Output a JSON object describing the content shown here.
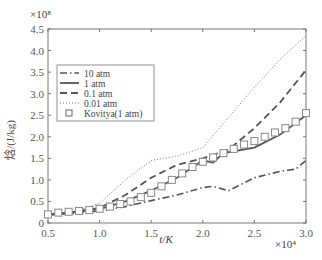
{
  "chart_data": {
    "type": "line",
    "title": "",
    "xlabel": "t/K",
    "ylabel": "焓/(J/kg)",
    "x_multiplier": "×10⁴",
    "y_multiplier": "×10⁸",
    "xlim": [
      0.5,
      3.0
    ],
    "ylim": [
      0,
      4.5
    ],
    "xticks": [
      "0.5",
      "1.0",
      "1.5",
      "2.0",
      "2.5",
      "3.0"
    ],
    "yticks": [
      "0",
      "0.5",
      "1.0",
      "1.5",
      "2.0",
      "2.5",
      "3.0",
      "3.5",
      "4.0",
      "4.5"
    ],
    "grid": false,
    "legend_position": "upper left",
    "series": [
      {
        "name": "10 atm",
        "style": "dash-dot",
        "x": [
          0.5,
          0.75,
          1.0,
          1.25,
          1.5,
          1.75,
          2.0,
          2.1,
          2.25,
          2.5,
          2.75,
          2.9,
          3.0
        ],
        "y": [
          0.18,
          0.22,
          0.28,
          0.38,
          0.52,
          0.65,
          0.82,
          0.85,
          0.75,
          1.05,
          1.2,
          1.25,
          1.45
        ]
      },
      {
        "name": "1 atm",
        "style": "solid",
        "x": [
          0.5,
          0.75,
          1.0,
          1.25,
          1.5,
          1.75,
          2.0,
          2.1,
          2.2,
          2.5,
          2.75,
          3.0
        ],
        "y": [
          0.2,
          0.25,
          0.32,
          0.5,
          0.75,
          1.05,
          1.45,
          1.4,
          1.62,
          1.75,
          2.05,
          2.5
        ]
      },
      {
        "name": "0.1 atm",
        "style": "dashed",
        "x": [
          0.5,
          0.75,
          1.0,
          1.25,
          1.5,
          1.75,
          2.0,
          2.25,
          2.5,
          2.75,
          3.0
        ],
        "y": [
          0.2,
          0.26,
          0.35,
          0.65,
          1.05,
          1.35,
          1.5,
          1.7,
          2.2,
          2.8,
          3.55
        ]
      },
      {
        "name": "0.01 atm",
        "style": "dotted",
        "x": [
          0.5,
          0.75,
          1.0,
          1.25,
          1.5,
          1.75,
          2.0,
          2.25,
          2.5,
          2.75,
          3.0
        ],
        "y": [
          0.2,
          0.27,
          0.45,
          1.0,
          1.45,
          1.55,
          1.75,
          2.45,
          3.15,
          3.8,
          4.35
        ]
      },
      {
        "name": "Kovitya(1 atm)",
        "style": "square-markers",
        "x": [
          0.5,
          0.6,
          0.7,
          0.8,
          0.9,
          1.0,
          1.1,
          1.2,
          1.3,
          1.4,
          1.5,
          1.6,
          1.7,
          1.8,
          1.9,
          2.0,
          2.1,
          2.2,
          2.3,
          2.4,
          2.5,
          2.6,
          2.7,
          2.8,
          2.9,
          3.0
        ],
        "y": [
          0.2,
          0.24,
          0.26,
          0.28,
          0.3,
          0.33,
          0.38,
          0.44,
          0.5,
          0.6,
          0.7,
          0.85,
          1.0,
          1.15,
          1.3,
          1.42,
          1.52,
          1.62,
          1.72,
          1.82,
          1.9,
          2.0,
          2.1,
          2.2,
          2.35,
          2.55
        ]
      }
    ]
  }
}
